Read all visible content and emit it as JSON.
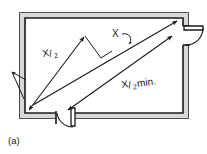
{
  "figure": {
    "caption": "(a)",
    "labels": {
      "egress_left": {
        "numerator": "X",
        "separator": "/",
        "denominator": "2"
      },
      "egress_right": {
        "numerator": "X",
        "separator": "/",
        "denominator": "2",
        "suffix": " min."
      },
      "separation": "X"
    },
    "colors": {
      "background": "#ffffff",
      "line": "#1a1a1a",
      "wall_fill": "#d8d8d8",
      "text": "#1a1a1a"
    },
    "elements": {
      "room_outline": "rectangular-room-plan-double-line-wall",
      "door_right": "door-opening-right-wall-with-swing-arc",
      "door_bottom": "door-opening-bottom-wall-with-swing-arc",
      "diagonal_upper": "dimension-line-upper-diagonal-double-arrow",
      "diagonal_lower": "dimension-line-lower-diagonal-double-arrow",
      "perpendicular_tick": "separation-distance-connector",
      "leader_x": "curved-leader-line-to-separation"
    }
  }
}
